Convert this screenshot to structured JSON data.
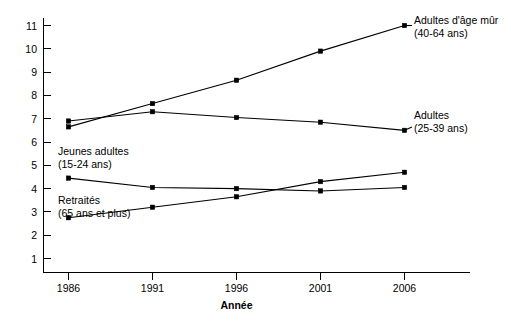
{
  "chart_data": {
    "type": "line",
    "title": "",
    "xlabel": "Année",
    "ylabel": "",
    "categories": [
      "1986",
      "1991",
      "1996",
      "2001",
      "2006"
    ],
    "x": [
      1986,
      1991,
      1996,
      2001,
      2006
    ],
    "xlim": [
      1984,
      2008
    ],
    "ylim": [
      0,
      11.6
    ],
    "y_ticks": [
      "1",
      "2",
      "3",
      "4",
      "5",
      "6",
      "7",
      "8",
      "9",
      "10",
      "11"
    ],
    "y_tick_values": [
      1,
      2,
      3,
      4,
      5,
      6,
      7,
      8,
      9,
      10,
      11
    ],
    "grid": false,
    "legend_position": "inline-annotations",
    "series": [
      {
        "name": "Adultes d'âge mûr",
        "sublabel": "(40-64 ans)",
        "label_line1": "Adultes d'âge mûr",
        "label_line2": "(40-64 ans)",
        "values": [
          6.65,
          7.65,
          8.65,
          9.9,
          11.0
        ],
        "color": "#000000"
      },
      {
        "name": "Adultes",
        "sublabel": "(25-39 ans)",
        "label_line1": "Adultes",
        "label_line2": "(25-39 ans)",
        "values": [
          6.9,
          7.3,
          7.05,
          6.85,
          6.5
        ],
        "color": "#000000"
      },
      {
        "name": "Jeunes adultes",
        "sublabel": "(15-24 ans)",
        "label_line1": "Jeunes adultes",
        "label_line2": "(15-24 ans)",
        "values": [
          4.45,
          4.05,
          4.0,
          3.9,
          4.05
        ],
        "color": "#000000"
      },
      {
        "name": "Retraités",
        "sublabel": "(65 ans et plus)",
        "label_line1": "Retraités",
        "label_line2": "(65 ans et plus)",
        "values": [
          2.75,
          3.2,
          3.65,
          4.3,
          4.7
        ],
        "color": "#000000"
      }
    ],
    "annotations": [
      {
        "id": "label-adultes-age-mur",
        "line1": "Adultes d'âge mûr",
        "line2": "(40-64 ans)",
        "x": 414,
        "y": 24
      },
      {
        "id": "label-adultes",
        "line1": "Adultes",
        "line2": "(25-39 ans)",
        "x": 414,
        "y": 119
      },
      {
        "id": "label-jeunes-adultes",
        "line1": "Jeunes adultes",
        "line2": "(15-24 ans)",
        "x": 58,
        "y": 155
      },
      {
        "id": "label-retraites",
        "line1": "Retraités",
        "line2": "(65 ans et plus)",
        "x": 58,
        "y": 204
      }
    ]
  },
  "axes": {
    "x_title": "Année",
    "x_tick_labels": [
      "1986",
      "1991",
      "1996",
      "2001",
      "2006"
    ],
    "y_tick_labels": [
      "11",
      "10",
      "9",
      "8",
      "7",
      "6",
      "5",
      "4",
      "3",
      "2",
      "1"
    ]
  }
}
